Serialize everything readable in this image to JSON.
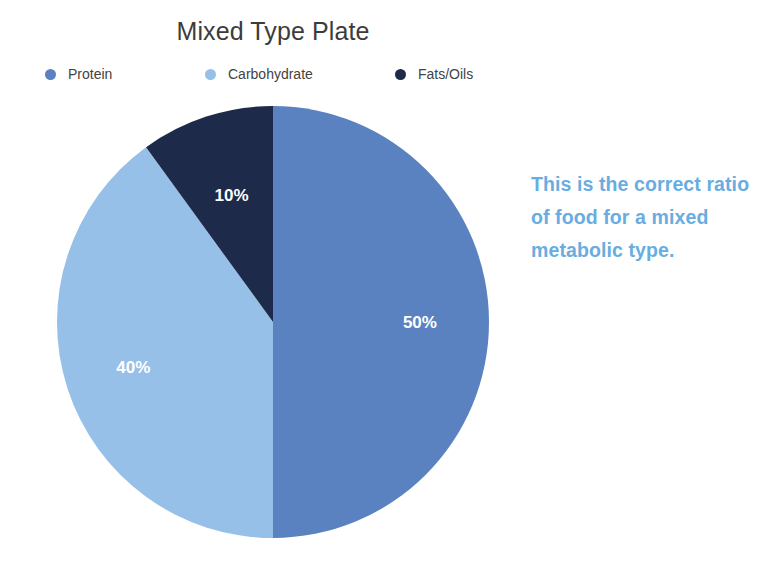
{
  "chart_data": {
    "type": "pie",
    "title": "Mixed Type Plate",
    "categories": [
      "Protein",
      "Carbohydrate",
      "Fats/Oils"
    ],
    "values": [
      50,
      40,
      10
    ],
    "value_labels": [
      "50%",
      "40%",
      "10%"
    ],
    "unit": "%",
    "colors": [
      "#5b82c0",
      "#96c0e8",
      "#1e2a4a"
    ],
    "legend_position": "top",
    "start_angle_deg": 0,
    "direction": "clockwise",
    "grid": false,
    "xlabel": "",
    "ylabel": "",
    "slices": [
      {
        "label": "Protein",
        "value": 50,
        "value_label": "50%",
        "color": "#5b82c0",
        "label_color": "#ffffff"
      },
      {
        "label": "Carbohydrate",
        "value": 40,
        "value_label": "40%",
        "color": "#96c0e8",
        "label_color": "#ffffff"
      },
      {
        "label": "Fats/Oils",
        "value": 10,
        "value_label": "10%",
        "color": "#1e2a4a",
        "label_color": "#ffffff"
      }
    ]
  },
  "title": "Mixed Type Plate",
  "legend": {
    "items": [
      {
        "label": "Protein",
        "color": "#5b82c0",
        "marker": "circle-marker-icon"
      },
      {
        "label": "Carbohydrate",
        "color": "#96c0e8",
        "marker": "circle-marker-icon"
      },
      {
        "label": "Fats/Oils",
        "color": "#1e2a4a",
        "marker": "circle-marker-icon"
      }
    ]
  },
  "annotation": {
    "text": "This is the correct ratio of food for a mixed metabolic type.",
    "color": "#68ade2"
  },
  "theme": {
    "background": "#ffffff",
    "title_color": "#3c3c3c",
    "legend_label_color": "#434343",
    "slice_label_color": "#ffffff"
  }
}
